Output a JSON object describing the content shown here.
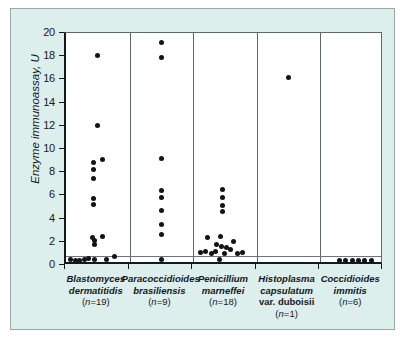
{
  "figure": {
    "background_color": "#dcefed",
    "plot_background_color": "#ffffff",
    "border_color": "#9aa9a8",
    "dot_color": "#111315"
  },
  "chart_data": {
    "type": "scatter",
    "title": "",
    "xlabel": "",
    "ylabel": "Enzyme immunoassay, U",
    "ylim": [
      0,
      20
    ],
    "yticks": [
      0,
      2,
      4,
      6,
      8,
      10,
      12,
      14,
      16,
      18,
      20
    ],
    "ytick_labels": [
      "0",
      "2",
      "4",
      "6",
      "8",
      "10",
      "12",
      "14",
      "16",
      "18",
      "20"
    ],
    "grid": false,
    "legend": "none",
    "annotations": [
      {
        "name": "cutoff-line",
        "type": "horizontal-line",
        "y": 0.8,
        "label": ""
      }
    ],
    "categories": [
      "Blastomyces dermatitidis (n=19)",
      "Paracoccidioides brasiliensis (n=9)",
      "Penicillium marneffei (n=18)",
      "Histoplasma capsulatum var. duboisii (n=1)",
      "Coccidioides immitis (n=6)"
    ],
    "series": [
      {
        "name": "Blastomyces dermatitidis",
        "n": 19,
        "points": [
          {
            "x": 0.5,
            "y": 18.1
          },
          {
            "x": 0.5,
            "y": 12.0
          },
          {
            "x": 0.58,
            "y": 9.1
          },
          {
            "x": 0.43,
            "y": 8.8
          },
          {
            "x": 0.43,
            "y": 8.2
          },
          {
            "x": 0.43,
            "y": 7.5
          },
          {
            "x": 0.43,
            "y": 5.7
          },
          {
            "x": 0.43,
            "y": 5.2
          },
          {
            "x": 0.57,
            "y": 2.5
          },
          {
            "x": 0.41,
            "y": 2.4
          },
          {
            "x": 0.45,
            "y": 2.1
          },
          {
            "x": 0.45,
            "y": 1.8
          },
          {
            "x": 0.07,
            "y": 0.5
          },
          {
            "x": 0.15,
            "y": 0.35
          },
          {
            "x": 0.22,
            "y": 0.4
          },
          {
            "x": 0.29,
            "y": 0.45
          },
          {
            "x": 0.36,
            "y": 0.6
          },
          {
            "x": 0.45,
            "y": 0.45
          },
          {
            "x": 0.64,
            "y": 0.5
          },
          {
            "x": 0.76,
            "y": 0.75
          }
        ]
      },
      {
        "name": "Paracoccidioides brasiliensis",
        "n": 9,
        "points": [
          {
            "x": 0.5,
            "y": 19.2
          },
          {
            "x": 0.5,
            "y": 17.9
          },
          {
            "x": 0.5,
            "y": 9.2
          },
          {
            "x": 0.5,
            "y": 6.4
          },
          {
            "x": 0.5,
            "y": 5.8
          },
          {
            "x": 0.5,
            "y": 4.7
          },
          {
            "x": 0.5,
            "y": 3.5
          },
          {
            "x": 0.5,
            "y": 2.6
          },
          {
            "x": 0.5,
            "y": 0.5
          }
        ]
      },
      {
        "name": "Penicillium marneffei",
        "n": 18,
        "points": [
          {
            "x": 0.46,
            "y": 6.5
          },
          {
            "x": 0.46,
            "y": 5.8
          },
          {
            "x": 0.46,
            "y": 5.1
          },
          {
            "x": 0.46,
            "y": 4.6
          },
          {
            "x": 0.22,
            "y": 2.4
          },
          {
            "x": 0.43,
            "y": 2.45
          },
          {
            "x": 0.63,
            "y": 2.05
          },
          {
            "x": 0.37,
            "y": 1.75
          },
          {
            "x": 0.45,
            "y": 1.6
          },
          {
            "x": 0.53,
            "y": 1.55
          },
          {
            "x": 0.58,
            "y": 1.3
          },
          {
            "x": 0.35,
            "y": 1.2
          },
          {
            "x": 0.11,
            "y": 1.1
          },
          {
            "x": 0.2,
            "y": 1.2
          },
          {
            "x": 0.29,
            "y": 0.95
          },
          {
            "x": 0.49,
            "y": 1.0
          },
          {
            "x": 0.7,
            "y": 1.0
          },
          {
            "x": 0.77,
            "y": 1.05
          },
          {
            "x": 0.42,
            "y": 0.45
          }
        ]
      },
      {
        "name": "Histoplasma capsulatum var. duboisii",
        "n": 1,
        "points": [
          {
            "x": 0.5,
            "y": 16.2
          }
        ]
      },
      {
        "name": "Coccidioides immitis",
        "n": 6,
        "points": [
          {
            "x": 0.3,
            "y": 0.4
          },
          {
            "x": 0.4,
            "y": 0.4
          },
          {
            "x": 0.5,
            "y": 0.4
          },
          {
            "x": 0.6,
            "y": 0.4
          },
          {
            "x": 0.7,
            "y": 0.4
          },
          {
            "x": 0.8,
            "y": 0.35
          }
        ]
      }
    ]
  },
  "axis": {
    "y_title": "Enzyme immunoassay, U"
  },
  "x_labels": [
    {
      "lines": [
        {
          "text": "Blastomyces",
          "style": "taxon"
        },
        {
          "text": "dermatitidis",
          "style": "taxon"
        }
      ],
      "count": "n=19"
    },
    {
      "lines": [
        {
          "text": "Paracoccidioides",
          "style": "taxon"
        },
        {
          "text": "brasiliensis",
          "style": "taxon"
        }
      ],
      "count": "n=9"
    },
    {
      "lines": [
        {
          "text": "Penicillium",
          "style": "taxon"
        },
        {
          "text": "marneffei",
          "style": "taxon"
        }
      ],
      "count": "n=18"
    },
    {
      "lines": [
        {
          "text": "Histoplasma",
          "style": "taxon"
        },
        {
          "text": "capsulatum",
          "style": "taxon"
        },
        {
          "text": "var. duboisii",
          "style": "plain"
        }
      ],
      "count": "n=1"
    },
    {
      "lines": [
        {
          "text": "Coccidioides",
          "style": "taxon"
        },
        {
          "text": "immitis",
          "style": "taxon"
        }
      ],
      "count": "n=6"
    }
  ]
}
